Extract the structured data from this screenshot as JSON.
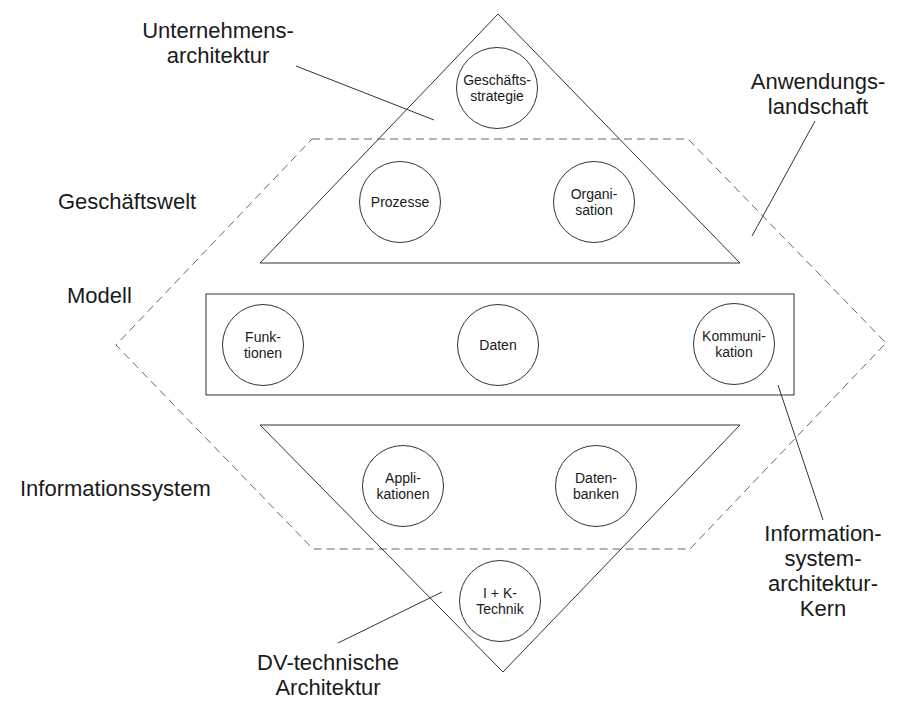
{
  "diagram": {
    "title_labels": {
      "unternehmensarchitektur": [
        "Unternehmens-",
        "architektur"
      ],
      "anwendungslandschaft": [
        "Anwendungs-",
        "landschaft"
      ],
      "geschaeftswelt": "Geschäftswelt",
      "modell": "Modell",
      "informationssystem": "Informationssystem",
      "isa_kern": [
        "Information-",
        "system-",
        "architektur-",
        "Kern"
      ],
      "dv_architektur": [
        "DV-technische",
        "Architektur"
      ]
    },
    "nodes": {
      "geschaeftsstrategie": [
        "Geschäfts-",
        "strategie"
      ],
      "prozesse": [
        "Prozesse"
      ],
      "organisation": [
        "Organi-",
        "sation"
      ],
      "funktionen": [
        "Funk-",
        "tionen"
      ],
      "daten": [
        "Daten"
      ],
      "kommunikation": [
        "Kommuni-",
        "kation"
      ],
      "applikationen": [
        "Appli-",
        "kationen"
      ],
      "datenbanken": [
        "Daten-",
        "banken"
      ],
      "ik_technik": [
        "I + K-",
        "Technik"
      ]
    },
    "colors": {
      "stroke": "#333333",
      "dashed_stroke": "#666666",
      "background": "#ffffff"
    }
  }
}
